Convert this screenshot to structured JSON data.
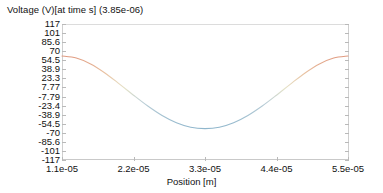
{
  "chart_data": {
    "type": "line",
    "title": "Voltage (V)[at time s] (3.85e-06)",
    "xlabel": "Position [m]",
    "ylabel": "",
    "xlim": [
      1.1e-05,
      5.5e-05
    ],
    "ylim": [
      -117,
      117
    ],
    "grid": false,
    "legend": "none",
    "xticks": [
      "1.1e-05",
      "2.2e-05",
      "3.3e-05",
      "4.4e-05",
      "5.5e-05"
    ],
    "xtick_values": [
      1.1e-05,
      2.2e-05,
      3.3e-05,
      4.4e-05,
      5.5e-05
    ],
    "yticks": [
      "117",
      "101",
      "85.6",
      "70",
      "54.5",
      "38.9",
      "23.3",
      "7.77",
      "-7.79",
      "-23.4",
      "-38.9",
      "-54.5",
      "-70",
      "-85.6",
      "-101",
      "-117"
    ],
    "ytick_values": [
      117,
      101,
      85.6,
      70,
      54.5,
      38.9,
      23.3,
      7.77,
      -7.79,
      -23.4,
      -38.9,
      -54.5,
      -70,
      -85.6,
      -101,
      -117
    ],
    "series": [
      {
        "name": "Voltage",
        "color_low": "#8fb6cc",
        "color_mid": "#e8e0b0",
        "color_high": "#e8a089",
        "x": [
          1.1e-05,
          1.32e-05,
          1.54e-05,
          1.76e-05,
          1.98e-05,
          2.2e-05,
          2.42e-05,
          2.64e-05,
          2.86e-05,
          3.08e-05,
          3.3e-05,
          3.52e-05,
          3.74e-05,
          3.96e-05,
          4.18e-05,
          4.4e-05,
          4.62e-05,
          4.84e-05,
          5.06e-05,
          5.28e-05,
          5.5e-05
        ],
        "y": [
          62.0,
          58.4,
          48.3,
          32.8,
          14.1,
          -5.5,
          -24.2,
          -40.5,
          -53.0,
          -60.7,
          -63.0,
          -60.7,
          -53.0,
          -40.5,
          -24.2,
          -5.5,
          14.1,
          32.8,
          48.3,
          58.4,
          62.0
        ]
      }
    ]
  }
}
